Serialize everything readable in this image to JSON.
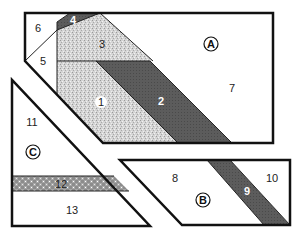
{
  "diagram": {
    "type": "quilt-pattern-pieces",
    "colors": {
      "outline": "#111111",
      "white": "#ffffff",
      "dark": "#5a5a5a",
      "speckle_light": "#d6d6d6",
      "check": "#8a8a8a"
    },
    "sections": {
      "A": {
        "label": "A",
        "pieces": [
          {
            "id": "1",
            "label": "1",
            "fill": "speckle"
          },
          {
            "id": "2",
            "label": "2",
            "fill": "dark"
          },
          {
            "id": "3",
            "label": "3",
            "fill": "speckle"
          },
          {
            "id": "4",
            "label": "4",
            "fill": "dark"
          },
          {
            "id": "5",
            "label": "5",
            "fill": "white"
          },
          {
            "id": "6",
            "label": "6",
            "fill": "white"
          },
          {
            "id": "7",
            "label": "7",
            "fill": "white"
          }
        ]
      },
      "B": {
        "label": "B",
        "pieces": [
          {
            "id": "8",
            "label": "8",
            "fill": "white"
          },
          {
            "id": "9",
            "label": "9",
            "fill": "dark"
          },
          {
            "id": "10",
            "label": "10",
            "fill": "white"
          }
        ]
      },
      "C": {
        "label": "C",
        "pieces": [
          {
            "id": "11",
            "label": "11",
            "fill": "white"
          },
          {
            "id": "12",
            "label": "12",
            "fill": "check"
          },
          {
            "id": "13",
            "label": "13",
            "fill": "white"
          }
        ]
      }
    }
  }
}
